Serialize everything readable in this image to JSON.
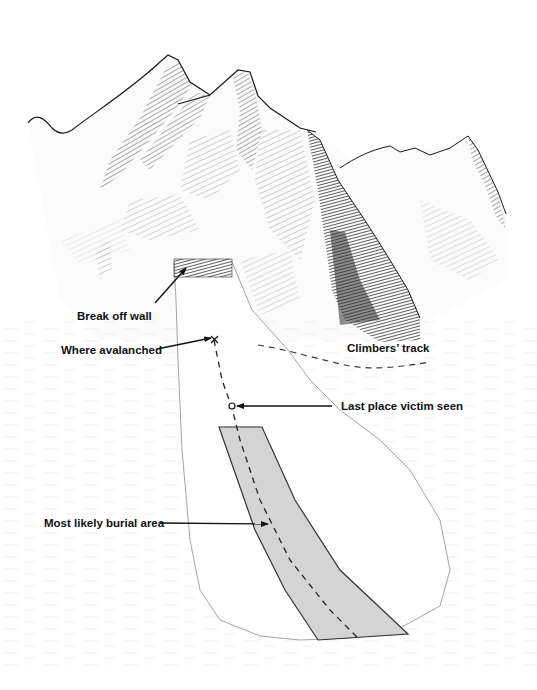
{
  "diagram": {
    "type": "labeled-illustration",
    "colors": {
      "ink": "#1a1a1a",
      "shadow": "#3a3a3a",
      "burial_area_fill": "#d4d4d4",
      "background": "#ffffff"
    },
    "labels": {
      "break_off_wall": "Break off wall",
      "where_avalanched": "Where avalanched",
      "climbers_track": "Climbers’ track",
      "last_place_seen": "Last place victim seen",
      "burial_area": "Most likely burial area"
    },
    "nodes": [
      {
        "id": "break_off_wall",
        "label": "Break off wall"
      },
      {
        "id": "where_avalanched",
        "label": "Where avalanched",
        "marker": "x"
      },
      {
        "id": "last_seen",
        "label": "Last place victim seen",
        "marker": "circle"
      },
      {
        "id": "burial_area",
        "label": "Most likely burial area",
        "marker": "shaded-band"
      },
      {
        "id": "climbers_track",
        "label": "Climbers’ track",
        "marker": "dashed-line"
      }
    ]
  }
}
